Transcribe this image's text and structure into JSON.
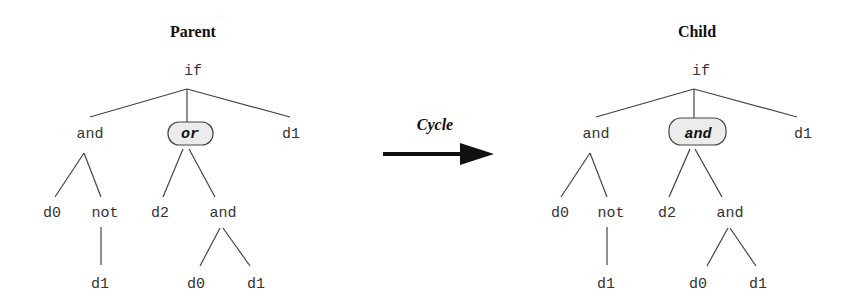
{
  "arrow": {
    "label": "Cycle"
  },
  "parent": {
    "title": "Parent",
    "root": "if",
    "level1": [
      "and",
      "or",
      "d1"
    ],
    "level2": [
      "d0",
      "not",
      "d2",
      "and"
    ],
    "level3": [
      "d1",
      "d0",
      "d1"
    ],
    "highlighted": "or"
  },
  "child": {
    "title": "Child",
    "root": "if",
    "level1": [
      "and",
      "and",
      "d1"
    ],
    "level2": [
      "d0",
      "not",
      "d2",
      "and"
    ],
    "level3": [
      "d1",
      "d0",
      "d1"
    ],
    "highlighted": "and"
  },
  "colors": {
    "highlight_fill": "#ececec",
    "line": "#444444",
    "text": "#333333"
  }
}
